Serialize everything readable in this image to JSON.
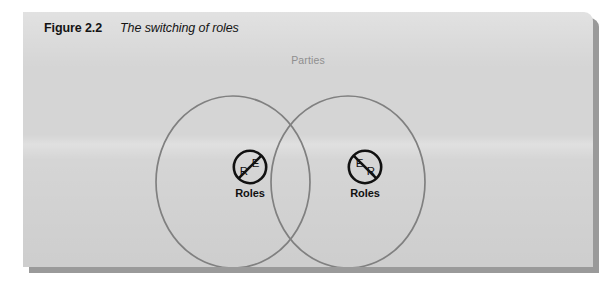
{
  "figure": {
    "caption_number": "Figure 2.2",
    "caption_title": "The switching of roles",
    "universe_label": "Parties",
    "colors": {
      "panel_background": "#d5d5d5",
      "panel_shadow": "#9a9a9a",
      "page_background": "#ffffff",
      "circle_stroke": "#808080",
      "universe_label_text": "#8f8f8f",
      "caption_text": "#141414",
      "badge_stroke": "#111111",
      "badge_text": "#111111"
    },
    "sets": [
      {
        "id": "party-left",
        "badge": {
          "top_letter": "E",
          "bottom_letter": "R",
          "top_letter_position": "upper-right",
          "bottom_letter_position": "lower-left",
          "slash_direction": "lower-left-to-upper-right"
        },
        "label": "Roles"
      },
      {
        "id": "party-right",
        "badge": {
          "top_letter": "E",
          "bottom_letter": "R",
          "top_letter_position": "upper-left",
          "bottom_letter_position": "lower-right",
          "slash_direction": "upper-left-to-lower-right"
        },
        "label": "Roles"
      }
    ]
  }
}
